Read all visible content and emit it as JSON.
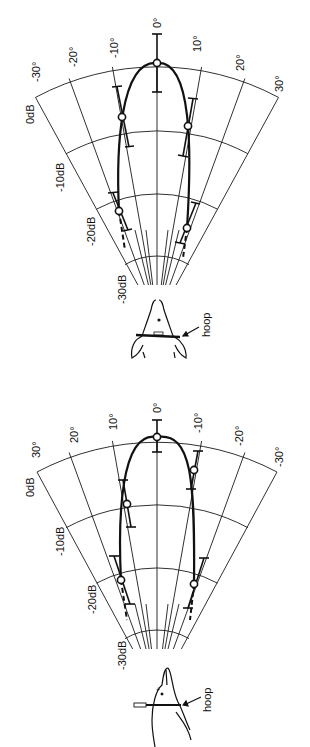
{
  "diagrams": [
    {
      "id": "upper",
      "orientation": "ventral view (dolphin seen from below/front)",
      "angle_labels_left_to_right": [
        "-30°",
        "-20°",
        "-10°",
        "0°",
        "10°",
        "20°",
        "30°"
      ],
      "db_labels": [
        "0dB",
        "-10dB",
        "-20dB",
        "-30dB"
      ],
      "annotation": "hoop"
    },
    {
      "id": "lower",
      "orientation": "side view (dolphin seen laterally)",
      "angle_labels_left_to_right": [
        "30°",
        "20°",
        "10°",
        "0°",
        "-10°",
        "-20°",
        "-30°"
      ],
      "db_labels": [
        "0dB",
        "-10dB",
        "-20dB",
        "-30dB"
      ],
      "annotation": "hoop"
    }
  ],
  "labels": {
    "upper": {
      "a0": "-30°",
      "a1": "-20°",
      "a2": "-10°",
      "a3": "0°",
      "a4": "10°",
      "a5": "20°",
      "a6": "30°",
      "db0": "0dB",
      "db1": "-10dB",
      "db2": "-20dB",
      "db3": "-30dB",
      "hoop": "hoop"
    },
    "lower": {
      "a0": "30°",
      "a1": "20°",
      "a2": "10°",
      "a3": "0°",
      "a4": "-10°",
      "a5": "-20°",
      "a6": "-30°",
      "db0": "0dB",
      "db1": "-10dB",
      "db2": "-20dB",
      "db3": "-30dB",
      "hoop": "hoop"
    }
  }
}
